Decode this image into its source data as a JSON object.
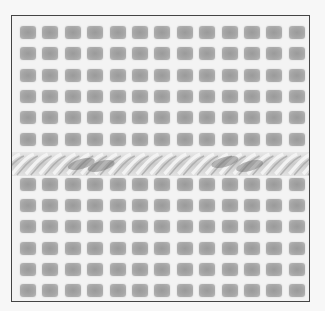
{
  "image": {
    "subject": "plastic canvas mesh with twisted yarn strand",
    "description": "Square grid of gray mesh holes with a single twisted two-tone yarn running horizontally across the middle",
    "grid": {
      "columns": 14,
      "rows_above_yarn": 6,
      "rows_below_yarn": 6
    },
    "colors": {
      "background": "#f7f7f7",
      "mesh_bar": "#f3f3f3",
      "hole": "#a0a0a0",
      "border": "#444444",
      "yarn_light": "#d8d8d8",
      "yarn_dark": "#6a6a6a"
    }
  }
}
